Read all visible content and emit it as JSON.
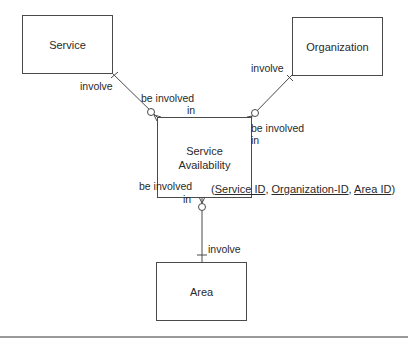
{
  "entities": {
    "service": "Service",
    "organization": "Organization",
    "service_availability_line1": "Service",
    "service_availability_line2": "Availability",
    "area": "Area"
  },
  "relationships": {
    "service_end": "involve",
    "service_sa_end_line1": "be involved",
    "service_sa_end_line2": "in",
    "organization_end": "involve",
    "organization_sa_end_line1": "be involved",
    "organization_sa_end_line2": "in",
    "area_sa_end_line1": "be involved",
    "area_sa_end_line2": "in",
    "area_end": "involve"
  },
  "key": {
    "open": "(",
    "attr1": "Service ID",
    "sep1": ", ",
    "attr2": "Organization-ID",
    "sep2": ", ",
    "attr3": "Area ID",
    "close": ")"
  }
}
